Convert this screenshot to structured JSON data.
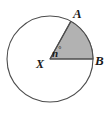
{
  "figure": {
    "kind": "circle-sector-diagram",
    "background_color": "#ffffff",
    "labels": {
      "point_a": "A",
      "point_b": "B",
      "center": "X",
      "angle": "n",
      "degree_symbol": "°"
    },
    "circle": {
      "center_x": 50,
      "center_y": 59,
      "radius": 43,
      "stroke_color": "#4d4d4d",
      "stroke_width": 1.1,
      "fill_color": "#ffffff"
    },
    "sector": {
      "fill_color": "#b2b2b2",
      "stroke_color": "#4d4d4d",
      "stroke_width": 1.1,
      "start_angle_deg": 0,
      "end_angle_deg": 61,
      "vertex_x": 50,
      "vertex_y": 59,
      "point_a_x": 70.8,
      "point_a_y": 21.4,
      "point_b_x": 93,
      "point_b_y": 59
    }
  }
}
